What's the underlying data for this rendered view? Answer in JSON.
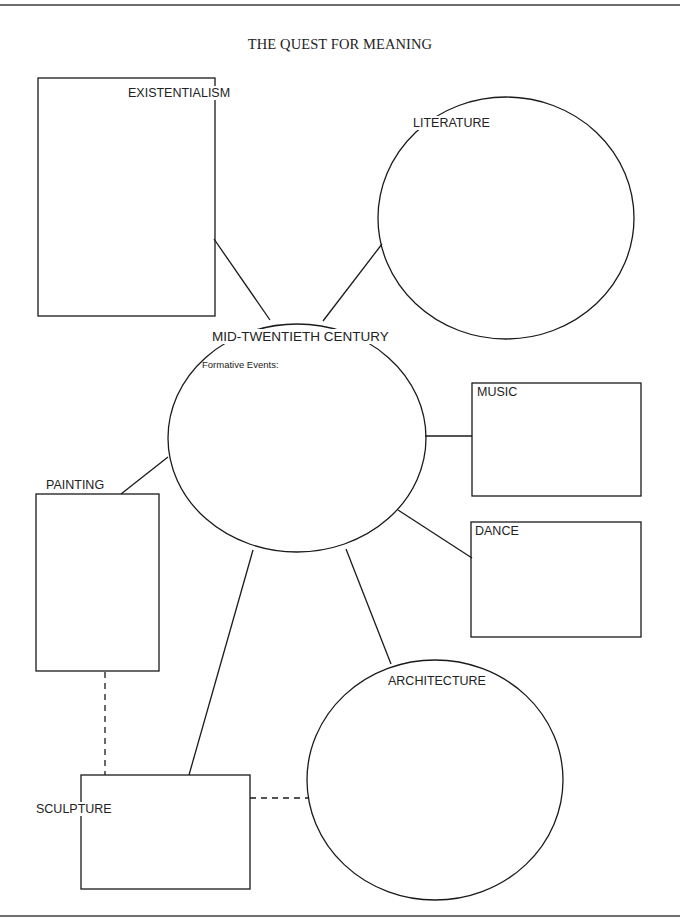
{
  "title": "THE QUEST FOR MEANING",
  "center": {
    "label": "MID-TWENTIETH CENTURY",
    "sublabel": "Formative Events:"
  },
  "nodes": {
    "existentialism": {
      "label": "EXISTENTIALISM",
      "shape": "rectangle"
    },
    "literature": {
      "label": "LITERATURE",
      "shape": "circle"
    },
    "music": {
      "label": "MUSIC",
      "shape": "rectangle"
    },
    "dance": {
      "label": "DANCE",
      "shape": "rectangle"
    },
    "painting": {
      "label": "PAINTING",
      "shape": "rectangle"
    },
    "architecture": {
      "label": "ARCHITECTURE",
      "shape": "circle"
    },
    "sculpture": {
      "label": "SCULPTURE",
      "shape": "rectangle"
    }
  },
  "connections": [
    {
      "from": "center",
      "to": "existentialism",
      "style": "solid"
    },
    {
      "from": "center",
      "to": "literature",
      "style": "solid"
    },
    {
      "from": "center",
      "to": "music",
      "style": "solid"
    },
    {
      "from": "center",
      "to": "dance",
      "style": "solid"
    },
    {
      "from": "center",
      "to": "painting",
      "style": "solid"
    },
    {
      "from": "center",
      "to": "architecture",
      "style": "solid"
    },
    {
      "from": "center",
      "to": "sculpture",
      "style": "solid"
    },
    {
      "from": "painting",
      "to": "sculpture",
      "style": "dashed"
    },
    {
      "from": "sculpture",
      "to": "architecture",
      "style": "dashed"
    }
  ],
  "colors": {
    "stroke": "#1a1a1a",
    "background": "#ffffff",
    "rule": "#6e6e6e"
  }
}
